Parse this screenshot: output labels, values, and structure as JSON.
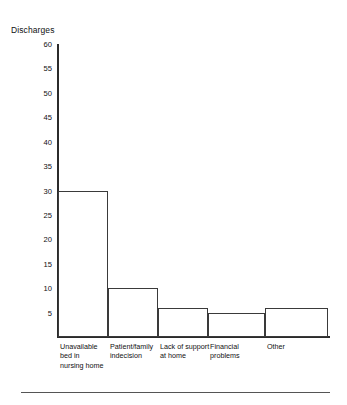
{
  "chart_data": {
    "type": "bar",
    "title": "Discharges",
    "xlabel": "",
    "ylabel": "Discharges",
    "categories": [
      "Unavailable bed in nursing home",
      "Patient/family indecision",
      "Lack of support at home",
      "Financial problems",
      "Other"
    ],
    "category_lines": [
      [
        "Unavailable",
        "bed in",
        "nursing home"
      ],
      [
        "Patient/family",
        "indecision"
      ],
      [
        "Lack of support",
        "at home"
      ],
      [
        "Financial",
        "problems"
      ],
      [
        "Other"
      ]
    ],
    "values": [
      30,
      10,
      6,
      5,
      6
    ],
    "ylim": [
      0,
      60
    ],
    "ytick_labels": [
      "60",
      "55",
      "50",
      "45",
      "40",
      "35",
      "30",
      "25",
      "20",
      "15",
      "10",
      "5"
    ],
    "ytick_values": [
      60,
      55,
      50,
      45,
      40,
      35,
      30,
      25,
      20,
      15,
      10,
      5
    ],
    "grid": false,
    "legend": false,
    "bar_fill_color": "#ffffff",
    "bar_edge_color": "#3a3a3a",
    "axis_color": "#2b2b2b",
    "text_color": "#111111",
    "background_color": "#ffffff",
    "bar_widths_px": [
      50,
      50,
      50,
      57,
      63
    ]
  }
}
